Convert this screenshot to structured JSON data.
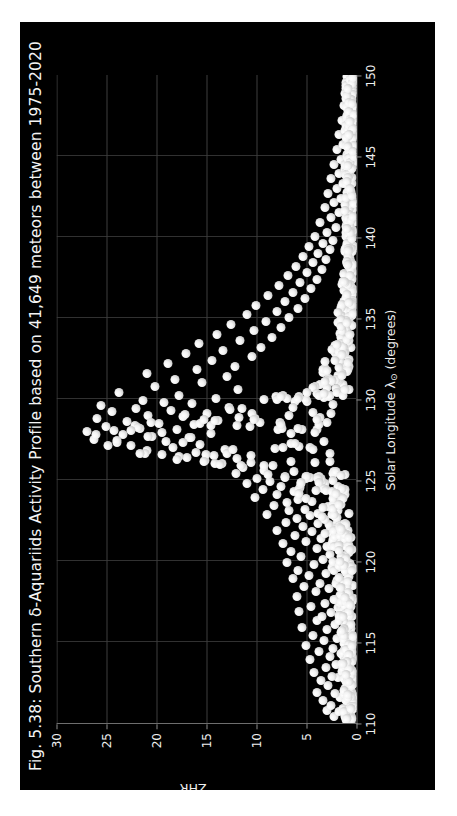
{
  "figure": {
    "title": "Fig. 5.38: Southern δ-Aquariids Activity Profile based on 41,649 meteors between 1975-2020",
    "background_color": "#000000",
    "page_color": "#ffffff",
    "text_color": "#f2f2f2",
    "marker_color": "#f0f0f0",
    "grid_color": "#4a4a4a",
    "axis_color": "#6e6e6e",
    "orientation": "rotated-90-ccw"
  },
  "chart_data": {
    "type": "scatter",
    "title": "Fig. 5.38: Southern δ-Aquariids Activity Profile based on 41,649 meteors between 1975-2020",
    "xlabel": "Solar Longitude λ⊙ (degrees)",
    "xlabel_parts": {
      "main": "Solar Longitude λ",
      "sub": "⊙",
      "units": " (degrees)"
    },
    "ylabel": "ZHR",
    "xlim": [
      110,
      150
    ],
    "ylim": [
      0,
      30
    ],
    "xticks": [
      110,
      115,
      120,
      125,
      130,
      135,
      140,
      145,
      150
    ],
    "yticks": [
      0,
      5,
      10,
      15,
      20,
      25,
      30
    ],
    "grid": true,
    "grid_axis": "both",
    "legend": null,
    "meteor_count": "41,649",
    "shower": "Southern δ-Aquariids",
    "years": "1975-2020",
    "peak_solar_longitude": 126.5,
    "peak_zhr": 27,
    "marker_size_px": 9,
    "points": [
      [
        110.2,
        1.1
      ],
      [
        110.4,
        2.3
      ],
      [
        110.5,
        0.7
      ],
      [
        110.7,
        1.8
      ],
      [
        110.8,
        3.0
      ],
      [
        110.9,
        1.4
      ],
      [
        111.1,
        2.6
      ],
      [
        111.3,
        0.9
      ],
      [
        111.4,
        3.4
      ],
      [
        111.6,
        1.7
      ],
      [
        111.8,
        2.2
      ],
      [
        111.9,
        4.0
      ],
      [
        112.1,
        1.2
      ],
      [
        112.3,
        2.9
      ],
      [
        112.4,
        0.6
      ],
      [
        112.6,
        3.6
      ],
      [
        112.8,
        1.9
      ],
      [
        112.9,
        2.5
      ],
      [
        113.1,
        4.3
      ],
      [
        113.2,
        1.5
      ],
      [
        113.4,
        3.1
      ],
      [
        113.6,
        2.1
      ],
      [
        113.8,
        0.8
      ],
      [
        113.9,
        4.7
      ],
      [
        114.1,
        2.7
      ],
      [
        114.3,
        1.6
      ],
      [
        114.4,
        3.8
      ],
      [
        114.6,
        2.4
      ],
      [
        114.8,
        5.1
      ],
      [
        114.9,
        1.3
      ],
      [
        115.1,
        3.3
      ],
      [
        115.2,
        2.0
      ],
      [
        115.4,
        4.4
      ],
      [
        115.6,
        1.0
      ],
      [
        115.8,
        3.0
      ],
      [
        115.9,
        5.5
      ],
      [
        116.1,
        2.2
      ],
      [
        116.3,
        4.0
      ],
      [
        116.4,
        1.7
      ],
      [
        116.6,
        3.5
      ],
      [
        116.8,
        2.6
      ],
      [
        116.9,
        5.8
      ],
      [
        117.1,
        1.9
      ],
      [
        117.2,
        4.6
      ],
      [
        117.4,
        3.2
      ],
      [
        117.6,
        2.3
      ],
      [
        117.8,
        6.0
      ],
      [
        117.9,
        1.5
      ],
      [
        118.1,
        4.1
      ],
      [
        118.3,
        2.8
      ],
      [
        118.4,
        5.3
      ],
      [
        118.6,
        3.7
      ],
      [
        118.8,
        2.0
      ],
      [
        118.9,
        6.4
      ],
      [
        119.1,
        4.8
      ],
      [
        119.2,
        3.1
      ],
      [
        119.4,
        5.9
      ],
      [
        119.6,
        2.5
      ],
      [
        119.8,
        4.3
      ],
      [
        119.9,
        7.0
      ],
      [
        120.1,
        3.4
      ],
      [
        120.3,
        5.6
      ],
      [
        120.4,
        2.7
      ],
      [
        120.6,
        6.6
      ],
      [
        120.8,
        4.0
      ],
      [
        120.9,
        3.0
      ],
      [
        121.1,
        7.4
      ],
      [
        121.2,
        5.1
      ],
      [
        121.4,
        3.6
      ],
      [
        121.6,
        6.2
      ],
      [
        121.8,
        4.5
      ],
      [
        121.9,
        8.0
      ],
      [
        122.1,
        5.4
      ],
      [
        122.3,
        3.9
      ],
      [
        122.4,
        7.1
      ],
      [
        122.6,
        6.0
      ],
      [
        122.8,
        4.7
      ],
      [
        122.9,
        9.0
      ],
      [
        123.1,
        6.8
      ],
      [
        123.2,
        5.2
      ],
      [
        123.4,
        8.3
      ],
      [
        123.6,
        7.0
      ],
      [
        123.8,
        5.9
      ],
      [
        123.9,
        10.2
      ],
      [
        124.1,
        8.0
      ],
      [
        124.3,
        6.3
      ],
      [
        124.4,
        9.4
      ],
      [
        124.6,
        7.6
      ],
      [
        124.8,
        11.0
      ],
      [
        124.9,
        8.7
      ],
      [
        125.1,
        10.0
      ],
      [
        125.2,
        7.2
      ],
      [
        125.4,
        12.1
      ],
      [
        125.6,
        9.3
      ],
      [
        125.8,
        11.4
      ],
      [
        125.9,
        8.4
      ],
      [
        126.0,
        13.5
      ],
      [
        126.1,
        10.6
      ],
      [
        126.2,
        15.2
      ],
      [
        126.3,
        12.0
      ],
      [
        126.4,
        17.0
      ],
      [
        126.5,
        14.3
      ],
      [
        126.6,
        19.5
      ],
      [
        126.7,
        16.1
      ],
      [
        126.8,
        21.0
      ],
      [
        126.9,
        13.2
      ],
      [
        127.0,
        18.4
      ],
      [
        127.1,
        22.6
      ],
      [
        127.2,
        15.7
      ],
      [
        127.3,
        24.0
      ],
      [
        127.4,
        19.1
      ],
      [
        127.5,
        26.3
      ],
      [
        127.6,
        16.8
      ],
      [
        127.7,
        20.5
      ],
      [
        127.8,
        23.4
      ],
      [
        127.9,
        14.6
      ],
      [
        128.0,
        27.0
      ],
      [
        128.1,
        18.0
      ],
      [
        128.2,
        21.7
      ],
      [
        128.3,
        25.1
      ],
      [
        128.4,
        16.3
      ],
      [
        128.5,
        19.8
      ],
      [
        128.6,
        23.0
      ],
      [
        128.7,
        13.9
      ],
      [
        128.8,
        26.0
      ],
      [
        128.9,
        17.4
      ],
      [
        129.0,
        20.9
      ],
      [
        129.1,
        15.0
      ],
      [
        129.2,
        24.5
      ],
      [
        129.3,
        18.6
      ],
      [
        129.4,
        22.1
      ],
      [
        129.5,
        12.8
      ],
      [
        129.6,
        25.6
      ],
      [
        129.7,
        16.5
      ],
      [
        129.8,
        19.3
      ],
      [
        129.9,
        21.4
      ],
      [
        130.0,
        14.1
      ],
      [
        130.2,
        17.8
      ],
      [
        130.4,
        23.8
      ],
      [
        130.6,
        11.9
      ],
      [
        130.8,
        20.2
      ],
      [
        131.0,
        15.5
      ],
      [
        131.2,
        18.2
      ],
      [
        131.4,
        13.0
      ],
      [
        131.6,
        21.0
      ],
      [
        131.8,
        16.0
      ],
      [
        132.0,
        12.2
      ],
      [
        132.2,
        18.9
      ],
      [
        132.4,
        14.5
      ],
      [
        132.6,
        10.5
      ],
      [
        132.8,
        17.1
      ],
      [
        133.0,
        13.4
      ],
      [
        133.2,
        9.6
      ],
      [
        133.4,
        15.8
      ],
      [
        133.6,
        11.7
      ],
      [
        133.8,
        8.5
      ],
      [
        134.0,
        14.0
      ],
      [
        134.2,
        10.3
      ],
      [
        134.4,
        7.6
      ],
      [
        134.6,
        12.6
      ],
      [
        134.8,
        9.1
      ],
      [
        135.0,
        6.8
      ],
      [
        135.2,
        11.0
      ],
      [
        135.4,
        8.0
      ],
      [
        135.6,
        5.9
      ],
      [
        135.8,
        10.1
      ],
      [
        136.0,
        7.2
      ],
      [
        136.2,
        5.2
      ],
      [
        136.4,
        8.9
      ],
      [
        136.6,
        6.4
      ],
      [
        136.8,
        4.6
      ],
      [
        137.0,
        7.8
      ],
      [
        137.2,
        5.7
      ],
      [
        137.4,
        4.0
      ],
      [
        137.6,
        6.9
      ],
      [
        137.8,
        5.0
      ],
      [
        138.0,
        3.5
      ],
      [
        138.2,
        6.1
      ],
      [
        138.4,
        4.4
      ],
      [
        138.6,
        3.1
      ],
      [
        138.8,
        5.4
      ],
      [
        139.0,
        3.9
      ],
      [
        139.2,
        2.7
      ],
      [
        139.4,
        4.8
      ],
      [
        139.6,
        3.4
      ],
      [
        139.8,
        2.4
      ],
      [
        140.0,
        4.2
      ],
      [
        140.3,
        3.0
      ],
      [
        140.6,
        2.1
      ],
      [
        140.9,
        3.7
      ],
      [
        141.2,
        2.6
      ],
      [
        141.5,
        1.8
      ],
      [
        141.8,
        3.2
      ],
      [
        142.1,
        2.3
      ],
      [
        142.4,
        1.6
      ],
      [
        142.7,
        2.9
      ],
      [
        143.0,
        2.0
      ],
      [
        143.3,
        1.4
      ],
      [
        143.6,
        2.6
      ],
      [
        143.9,
        1.8
      ],
      [
        144.2,
        1.2
      ],
      [
        144.5,
        2.3
      ],
      [
        144.8,
        1.6
      ],
      [
        145.1,
        1.0
      ],
      [
        145.4,
        2.0
      ],
      [
        145.7,
        1.4
      ],
      [
        146.0,
        0.9
      ],
      [
        146.3,
        1.8
      ],
      [
        146.6,
        1.2
      ],
      [
        146.9,
        0.7
      ],
      [
        147.2,
        1.5
      ],
      [
        147.5,
        1.0
      ],
      [
        147.8,
        0.6
      ],
      [
        148.1,
        1.3
      ],
      [
        148.4,
        0.8
      ]
    ]
  }
}
